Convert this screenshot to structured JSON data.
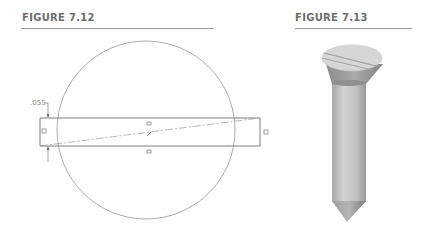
{
  "figures": [
    {
      "title": "FIGURE 7.12",
      "dimension_label": ".055",
      "description": "Circle with horizontal slot rectangle and diagonal centerline"
    },
    {
      "title": "FIGURE 7.13",
      "description": "Rendered flat-head slotted screw"
    }
  ],
  "colors": {
    "title_text": "#6d6d6d",
    "rule": "#9a9a9a",
    "line": "#6f6f6f",
    "screw_light": "#d9d9d9",
    "screw_mid": "#b8b8b8",
    "screw_dark": "#8f8f8f"
  }
}
